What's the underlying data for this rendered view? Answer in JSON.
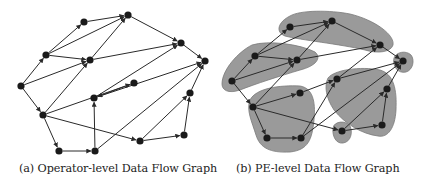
{
  "figure": {
    "panels": [
      {
        "id": "a",
        "caption": "(a) Operator-level Data Flow Graph",
        "nodes": [
          {
            "id": "A",
            "x": 21,
            "y": 86
          },
          {
            "id": "B",
            "x": 46,
            "y": 55
          },
          {
            "id": "C",
            "x": 84,
            "y": 22
          },
          {
            "id": "D",
            "x": 128,
            "y": 15
          },
          {
            "id": "E",
            "x": 90,
            "y": 60
          },
          {
            "id": "F",
            "x": 181,
            "y": 43
          },
          {
            "id": "G",
            "x": 205,
            "y": 61
          },
          {
            "id": "H",
            "x": 134,
            "y": 83
          },
          {
            "id": "I",
            "x": 94,
            "y": 98
          },
          {
            "id": "J",
            "x": 43,
            "y": 115
          },
          {
            "id": "K",
            "x": 190,
            "y": 93
          },
          {
            "id": "L",
            "x": 59,
            "y": 151
          },
          {
            "id": "M",
            "x": 95,
            "y": 151
          },
          {
            "id": "N",
            "x": 140,
            "y": 141
          },
          {
            "id": "O",
            "x": 184,
            "y": 135
          }
        ],
        "clusters": []
      },
      {
        "id": "b",
        "caption": "(b) PE-level Data Flow Graph",
        "nodes": [
          {
            "id": "A",
            "x": 232,
            "y": 81
          },
          {
            "id": "B",
            "x": 255,
            "y": 56
          },
          {
            "id": "C",
            "x": 290,
            "y": 27
          },
          {
            "id": "D",
            "x": 332,
            "y": 21
          },
          {
            "id": "E",
            "x": 297,
            "y": 60
          },
          {
            "id": "F",
            "x": 380,
            "y": 45
          },
          {
            "id": "G",
            "x": 403,
            "y": 61
          },
          {
            "id": "H",
            "x": 300,
            "y": 93
          },
          {
            "id": "I",
            "x": 337,
            "y": 79
          },
          {
            "id": "J",
            "x": 253,
            "y": 107
          },
          {
            "id": "K",
            "x": 387,
            "y": 89
          },
          {
            "id": "L",
            "x": 267,
            "y": 138
          },
          {
            "id": "M",
            "x": 301,
            "y": 138
          },
          {
            "id": "N",
            "x": 342,
            "y": 131
          },
          {
            "id": "O",
            "x": 382,
            "y": 125
          }
        ],
        "clusters": [
          {
            "name": "pe-top",
            "path": "M290 16 C300 10 330 10 350 14 C375 20 395 35 393 45 C391 52 378 54 365 50 C340 44 300 40 285 36 C275 32 278 22 290 16 Z"
          },
          {
            "name": "pe-left",
            "path": "M222 84 C222 70 238 52 252 45 C268 40 300 44 315 52 C322 58 316 66 300 70 C280 76 255 84 240 90 C228 94 222 90 222 84 Z"
          },
          {
            "name": "pe-right-single",
            "path": "M394 58 C396 52 406 50 411 55 C415 60 413 70 406 72 C398 74 392 66 394 58 Z"
          },
          {
            "name": "pe-bottom-left",
            "path": "M250 100 C256 88 280 85 300 86 C312 88 316 100 314 120 C312 140 308 150 290 152 C270 153 260 148 256 135 C252 122 246 110 250 100 Z"
          },
          {
            "name": "pe-right-mid",
            "path": "M328 78 C334 70 360 66 380 70 C394 74 397 90 396 110 C395 128 388 138 378 136 C362 134 345 124 334 110 C326 98 324 86 328 78 Z"
          },
          {
            "name": "pe-bottom-single",
            "path": "M333 128 C334 121 346 120 350 126 C353 132 351 142 343 143 C336 144 332 136 333 128 Z"
          }
        ]
      }
    ],
    "edges": [
      [
        "A",
        "B"
      ],
      [
        "A",
        "E"
      ],
      [
        "A",
        "J"
      ],
      [
        "B",
        "C"
      ],
      [
        "B",
        "D"
      ],
      [
        "B",
        "E"
      ],
      [
        "C",
        "D"
      ],
      [
        "E",
        "D"
      ],
      [
        "E",
        "F"
      ],
      [
        "D",
        "F"
      ],
      [
        "F",
        "G"
      ],
      [
        "J",
        "E"
      ],
      [
        "J",
        "H"
      ],
      [
        "J",
        "L"
      ],
      [
        "J",
        "N"
      ],
      [
        "H",
        "I"
      ],
      [
        "I",
        "F"
      ],
      [
        "I",
        "G"
      ],
      [
        "L",
        "M"
      ],
      [
        "M",
        "I"
      ],
      [
        "M",
        "G"
      ],
      [
        "N",
        "O"
      ],
      [
        "N",
        "K"
      ],
      [
        "O",
        "K"
      ],
      [
        "K",
        "G"
      ]
    ],
    "colors": {
      "node": "#1a1a1a",
      "edge": "#2a2a2a",
      "cluster_fill": "#9a9a9a",
      "cluster_stroke": "#7a7a7a",
      "caption": "#222222"
    }
  }
}
